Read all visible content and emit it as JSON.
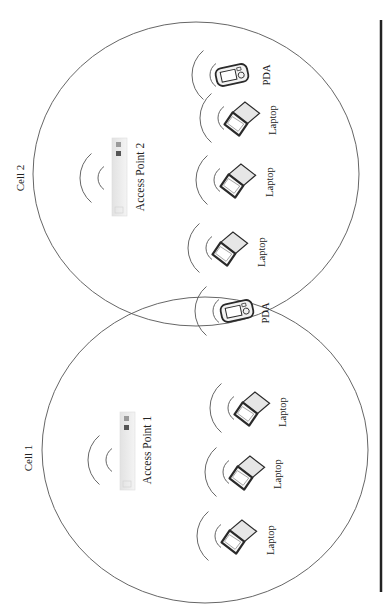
{
  "diagram": {
    "cells": [
      {
        "id": "cell2",
        "label": "Cell 2",
        "ellipse": {
          "cx": 196,
          "cy": 174,
          "rx": 163,
          "ry": 152
        },
        "label_pos": {
          "x": 20,
          "y": 178
        },
        "access_point": {
          "label": "Access Point 2",
          "x": 112,
          "y": 138,
          "w": 15,
          "h": 78,
          "label_x": 140,
          "label_y": 177,
          "wave_cx": 112,
          "wave_cy": 178
        },
        "devices": [
          {
            "type": "pda",
            "label": "PDA",
            "x": 232,
            "y": 75,
            "label_x": 266,
            "label_y": 75
          },
          {
            "type": "laptop",
            "label": "Laptop",
            "x": 240,
            "y": 118,
            "label_x": 272,
            "label_y": 120
          },
          {
            "type": "laptop",
            "label": "Laptop",
            "x": 236,
            "y": 180,
            "label_x": 269,
            "label_y": 182
          },
          {
            "type": "laptop",
            "label": "Laptop",
            "x": 228,
            "y": 248,
            "label_x": 261,
            "label_y": 252
          }
        ]
      },
      {
        "id": "cell1",
        "label": "Cell 1",
        "ellipse": {
          "cx": 205,
          "cy": 450,
          "rx": 163,
          "ry": 153
        },
        "label_pos": {
          "x": 28,
          "y": 458
        },
        "access_point": {
          "label": "Access Point 1",
          "x": 120,
          "y": 412,
          "w": 15,
          "h": 78,
          "label_x": 147,
          "label_y": 450,
          "wave_cx": 120,
          "wave_cy": 460
        },
        "devices": [
          {
            "type": "laptop",
            "label": "Laptop",
            "x": 250,
            "y": 408,
            "label_x": 282,
            "label_y": 412
          },
          {
            "type": "laptop",
            "label": "Laptop",
            "x": 245,
            "y": 472,
            "label_x": 277,
            "label_y": 474
          },
          {
            "type": "laptop",
            "label": "Laptop",
            "x": 237,
            "y": 536,
            "label_x": 270,
            "label_y": 540
          }
        ]
      }
    ],
    "roaming_device": {
      "type": "pda",
      "label": "PDA",
      "x": 237,
      "y": 311,
      "label_x": 265,
      "label_y": 313
    },
    "divider": {
      "x": 381,
      "y1": 20,
      "y2": 592
    },
    "colors": {
      "line": "#555555",
      "divider": "#222222",
      "device_stroke": "#2a2a2a",
      "device_fill": "#e6e6e6"
    }
  }
}
